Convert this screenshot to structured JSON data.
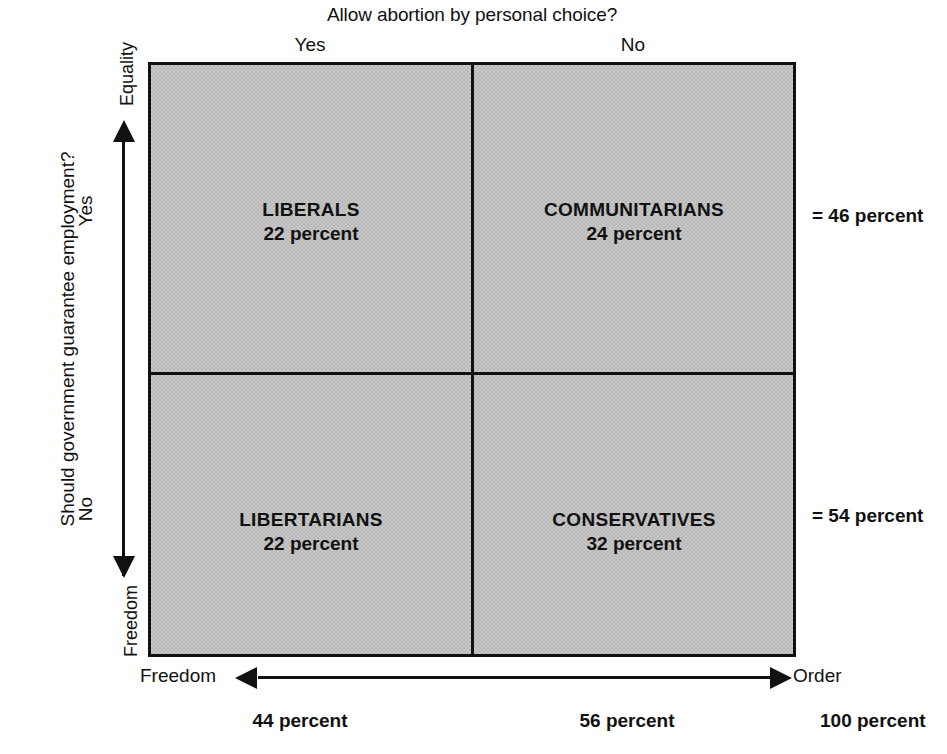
{
  "top": {
    "question": "Allow abortion by personal choice?",
    "column_labels": [
      "Yes",
      "No"
    ]
  },
  "left": {
    "question": "Should government guarantee employment?",
    "row_labels": [
      "Yes",
      "No"
    ],
    "axis_top": "Equality",
    "axis_bottom": "Freedom"
  },
  "bottom": {
    "axis_left": "Freedom",
    "axis_right": "Order",
    "column_totals": [
      "44 percent",
      "56 percent"
    ],
    "grand_total": "100 percent"
  },
  "right": {
    "row_totals": [
      "= 46 percent",
      "= 54 percent"
    ]
  },
  "quadrants": [
    {
      "name": "LIBERALS",
      "value": "22 percent"
    },
    {
      "name": "COMMUNITARIANS",
      "value": "24 percent"
    },
    {
      "name": "LIBERTARIANS",
      "value": "22 percent"
    },
    {
      "name": "CONSERVATIVES",
      "value": "32 percent"
    }
  ],
  "colors": {
    "background": "#ffffff",
    "ink": "#111111",
    "quadrant_fill": "#c2c2c2"
  },
  "chart_data": {
    "type": "heatmap",
    "title": "Allow abortion by personal choice?",
    "xlabel": "Allow abortion by personal choice?",
    "ylabel": "Should government guarantee employment?",
    "x_categories": [
      "Yes",
      "No"
    ],
    "y_categories": [
      "Yes",
      "No"
    ],
    "x_axis_poles": [
      "Freedom",
      "Order"
    ],
    "y_axis_poles": [
      "Freedom",
      "Equality"
    ],
    "cells": [
      {
        "x": "Yes",
        "y": "Yes",
        "label": "LIBERALS",
        "value": 22,
        "unit": "percent"
      },
      {
        "x": "No",
        "y": "Yes",
        "label": "COMMUNITARIANS",
        "value": 24,
        "unit": "percent"
      },
      {
        "x": "Yes",
        "y": "No",
        "label": "LIBERTARIANS",
        "value": 22,
        "unit": "percent"
      },
      {
        "x": "No",
        "y": "No",
        "label": "CONSERVATIVES",
        "value": 32,
        "unit": "percent"
      }
    ],
    "row_totals": [
      {
        "y": "Yes",
        "value": 46,
        "unit": "percent",
        "label": "= 46 percent"
      },
      {
        "y": "No",
        "value": 54,
        "unit": "percent",
        "label": "= 54 percent"
      }
    ],
    "column_totals": [
      {
        "x": "Yes",
        "value": 44,
        "unit": "percent",
        "label": "44 percent"
      },
      {
        "x": "No",
        "value": 56,
        "unit": "percent",
        "label": "56 percent"
      }
    ],
    "grand_total": {
      "value": 100,
      "unit": "percent",
      "label": "100 percent"
    },
    "grid": true,
    "legend": "none"
  }
}
